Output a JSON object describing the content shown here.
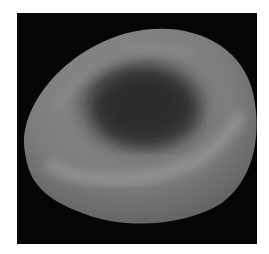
{
  "image": {
    "subject": "red blood cell (erythrocyte), scanning electron micrograph",
    "style": "grayscale",
    "colors": {
      "background": "#050505",
      "page": "#ffffff",
      "cell_light": "#9a9a9a",
      "cell_mid": "#7a7a7a",
      "cell_dark": "#2e2e2e"
    }
  }
}
